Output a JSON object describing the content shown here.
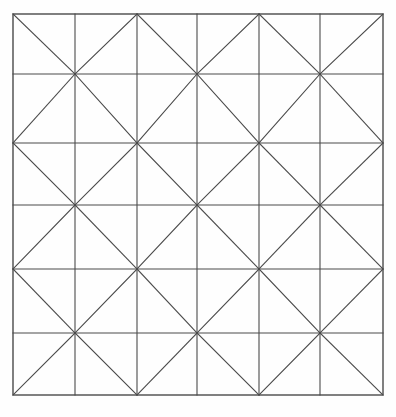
{
  "figure": {
    "canvas": {
      "width": 396,
      "height": 417
    },
    "background_color": "#fefefe",
    "line_color": "#4a4a4a",
    "line_width": 1.1,
    "border_color": "#4a4a4a",
    "border_width": 1.4
  },
  "grid": {
    "columns": 6,
    "rows": 6,
    "x_positions": [
      13,
      75,
      137,
      197,
      259,
      320,
      383
    ],
    "y_positions": [
      14,
      74,
      143,
      205,
      269,
      333,
      395
    ],
    "left": 13,
    "top": 14,
    "right": 383,
    "bottom": 395
  },
  "diagonals": {
    "pattern": "checkerboard",
    "description": "Each cell holds one diagonal; orientation alternates by (row+col) parity producing diamond motifs",
    "cells": [
      [
        "tl-br",
        "tr-bl",
        "tl-br",
        "tr-bl",
        "tl-br",
        "tr-bl"
      ],
      [
        "tr-bl",
        "tl-br",
        "tr-bl",
        "tl-br",
        "tr-bl",
        "tl-br"
      ],
      [
        "tl-br",
        "tr-bl",
        "tl-br",
        "tr-bl",
        "tl-br",
        "tr-bl"
      ],
      [
        "tr-bl",
        "tl-br",
        "tr-bl",
        "tl-br",
        "tr-bl",
        "tl-br"
      ],
      [
        "tl-br",
        "tr-bl",
        "tl-br",
        "tr-bl",
        "tl-br",
        "tr-bl"
      ],
      [
        "tr-bl",
        "tl-br",
        "tr-bl",
        "tl-br",
        "tr-bl",
        "tl-br"
      ]
    ]
  },
  "chart_data": {
    "type": "line",
    "xlabel": "",
    "ylabel": "",
    "xlim": [
      13,
      383
    ],
    "ylim": [
      14,
      395
    ],
    "grid": true,
    "legend": "none",
    "series": [
      {
        "name": "vertical-gridlines",
        "values": [
          13,
          75,
          137,
          197,
          259,
          320,
          383
        ]
      },
      {
        "name": "horizontal-gridlines",
        "values": [
          14,
          74,
          143,
          205,
          269,
          333,
          395
        ]
      },
      {
        "name": "diagonal-count",
        "values": [
          36
        ]
      }
    ]
  }
}
